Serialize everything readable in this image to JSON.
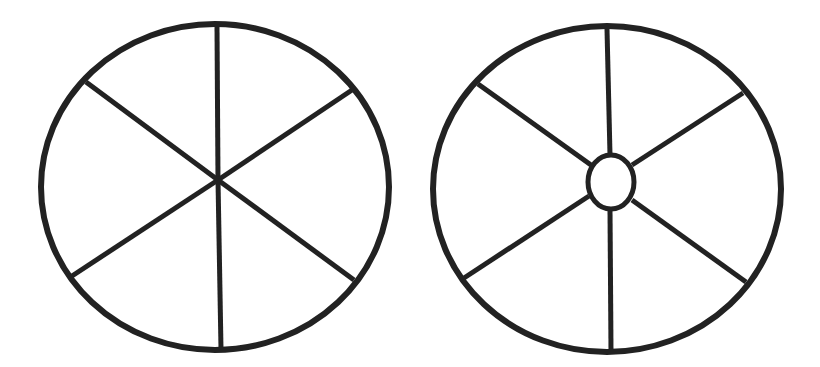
{
  "diagram": {
    "background": "#ffffff",
    "stroke_color": "#222222",
    "wheels": [
      {
        "name": "wheel-without-hub",
        "rim": {
          "cx": 215,
          "cy": 187,
          "rx": 174,
          "ry": 163,
          "stroke_width": 6
        },
        "spokes": [
          {
            "x1": 217,
            "y1": 27,
            "x2": 218,
            "y2": 180
          },
          {
            "x1": 352,
            "y1": 90,
            "x2": 218,
            "y2": 180
          },
          {
            "x1": 354,
            "y1": 280,
            "x2": 218,
            "y2": 180
          },
          {
            "x1": 221,
            "y1": 349,
            "x2": 218,
            "y2": 180
          },
          {
            "x1": 72,
            "y1": 276,
            "x2": 218,
            "y2": 180
          },
          {
            "x1": 86,
            "y1": 82,
            "x2": 218,
            "y2": 180
          }
        ],
        "spoke_width": 5,
        "hub": null
      },
      {
        "name": "wheel-with-hub",
        "rim": {
          "cx": 607,
          "cy": 189,
          "rx": 174,
          "ry": 163,
          "stroke_width": 6
        },
        "spokes": [
          {
            "x1": 607,
            "y1": 29,
            "x2": 610,
            "y2": 155
          },
          {
            "x1": 743,
            "y1": 93,
            "x2": 632,
            "y2": 165
          },
          {
            "x1": 746,
            "y1": 282,
            "x2": 632,
            "y2": 200
          },
          {
            "x1": 611,
            "y1": 351,
            "x2": 610,
            "y2": 210
          },
          {
            "x1": 464,
            "y1": 278,
            "x2": 589,
            "y2": 196
          },
          {
            "x1": 478,
            "y1": 84,
            "x2": 591,
            "y2": 165
          }
        ],
        "spoke_width": 5,
        "hub": {
          "cx": 611,
          "cy": 182,
          "rx": 23,
          "ry": 27,
          "stroke_width": 5
        }
      }
    ]
  }
}
